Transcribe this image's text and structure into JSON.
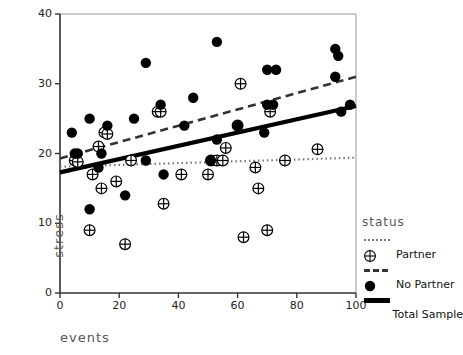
{
  "chart_data": {
    "type": "scatter",
    "title": "",
    "xlabel": "events",
    "ylabel": "stress",
    "xlim": [
      0,
      100
    ],
    "ylim": [
      0,
      40
    ],
    "xticks": [
      0,
      20,
      40,
      60,
      80,
      100
    ],
    "yticks": [
      0,
      10,
      20,
      30,
      40
    ],
    "grid": false,
    "legend": {
      "title": "status",
      "position": "right",
      "entries": [
        {
          "label": "Partner",
          "marker": "circle-plus-open",
          "line": "dotted"
        },
        {
          "label": "No Partner",
          "marker": "filled-circle",
          "line": "dashed"
        },
        {
          "label": "Total Sample",
          "marker": "none",
          "line": "solid"
        }
      ]
    },
    "series": [
      {
        "name": "Partner",
        "marker": "circle-plus-open",
        "points": [
          [
            5,
            19
          ],
          [
            6,
            18.8
          ],
          [
            10,
            9
          ],
          [
            11,
            17
          ],
          [
            13,
            21
          ],
          [
            14,
            15
          ],
          [
            15,
            23
          ],
          [
            16,
            22.8
          ],
          [
            19,
            16
          ],
          [
            22,
            7
          ],
          [
            24,
            19
          ],
          [
            33,
            26
          ],
          [
            34,
            26
          ],
          [
            35,
            12.8
          ],
          [
            41,
            17
          ],
          [
            50,
            17
          ],
          [
            51,
            19
          ],
          [
            53,
            19
          ],
          [
            55,
            19
          ],
          [
            56,
            20.8
          ],
          [
            60,
            24
          ],
          [
            61,
            30
          ],
          [
            62,
            8
          ],
          [
            66,
            18
          ],
          [
            67,
            15
          ],
          [
            70,
            9
          ],
          [
            71,
            26
          ],
          [
            76,
            19
          ],
          [
            87,
            20.6
          ]
        ]
      },
      {
        "name": "No Partner",
        "marker": "filled-circle",
        "points": [
          [
            4,
            23
          ],
          [
            5,
            20
          ],
          [
            6,
            20
          ],
          [
            10,
            25
          ],
          [
            10,
            12
          ],
          [
            13,
            18
          ],
          [
            14,
            20
          ],
          [
            16,
            24
          ],
          [
            22,
            14
          ],
          [
            25,
            25
          ],
          [
            29,
            33
          ],
          [
            29,
            19
          ],
          [
            34,
            27
          ],
          [
            35,
            17
          ],
          [
            42,
            24
          ],
          [
            45,
            28
          ],
          [
            51,
            19
          ],
          [
            53,
            22
          ],
          [
            53,
            36
          ],
          [
            60,
            24
          ],
          [
            69,
            23
          ],
          [
            70,
            32
          ],
          [
            70,
            27
          ],
          [
            72,
            27
          ],
          [
            73,
            32
          ],
          [
            93,
            31
          ],
          [
            93,
            35
          ],
          [
            94,
            34
          ],
          [
            95,
            26
          ],
          [
            98,
            27
          ]
        ]
      }
    ],
    "fit_lines": [
      {
        "name": "Partner",
        "style": "dotted",
        "x0": 0,
        "y0": 18.1,
        "x1": 100,
        "y1": 19.4
      },
      {
        "name": "No Partner",
        "style": "dashed",
        "x0": 0,
        "y0": 19.3,
        "x1": 100,
        "y1": 31.0
      },
      {
        "name": "Total Sample",
        "style": "solid",
        "x0": 0,
        "y0": 17.3,
        "x1": 100,
        "y1": 26.8
      }
    ]
  },
  "axes": {
    "x_tick_labels": [
      "0",
      "20",
      "40",
      "60",
      "80",
      "100"
    ],
    "y_tick_labels": [
      "0",
      "10",
      "20",
      "30",
      "40"
    ],
    "xlabel": "events",
    "ylabel": "stress"
  },
  "legend": {
    "title": "status",
    "partner_label": "Partner",
    "no_partner_label": "No Partner",
    "total_label": "Total Sample"
  }
}
